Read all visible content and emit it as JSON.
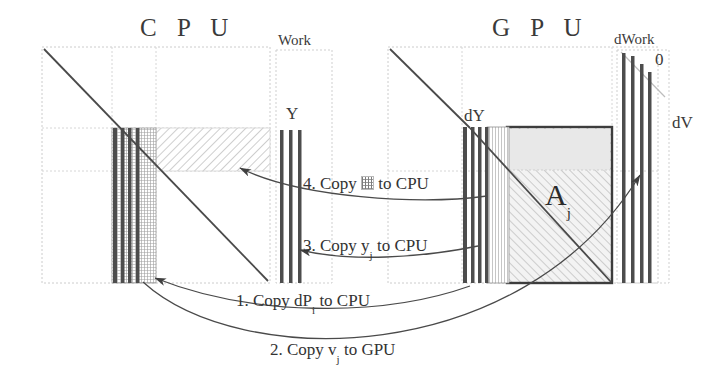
{
  "diagram": {
    "title_cpu": "C P U",
    "title_gpu": "G P U",
    "cpu_work_label": "Work",
    "cpu_vector_label": "Y",
    "gpu_work_label": "dWork",
    "gpu_zero_label": "0",
    "gpu_vector_label": "dY",
    "gpu_dv_label": "dV",
    "gpu_matrix_label": "A",
    "gpu_matrix_sub": "j"
  },
  "steps": [
    {
      "num": "4.",
      "verb": "Copy",
      "icon": "hatched-block-swatch",
      "operand": "",
      "sub": "",
      "dest": "to CPU"
    },
    {
      "num": "3.",
      "verb": "Copy",
      "icon": "",
      "operand": "y",
      "sub": "j",
      "dest": "to CPU"
    },
    {
      "num": "1.",
      "verb": "Copy",
      "icon": "",
      "operand": "dP",
      "sub": "i",
      "dest": "to CPU"
    },
    {
      "num": "2.",
      "verb": "Copy",
      "icon": "",
      "operand": "v",
      "sub": "j",
      "dest": "to GPU"
    }
  ],
  "colors": {
    "ink": "#3a3a3a",
    "line": "#555555",
    "dotted_frame": "#c9c9c9",
    "bar_dark": "#4a4a4a",
    "hatch_light": "#cfcfcf",
    "block_fill": "#efefef",
    "matrix_border": "#404040"
  }
}
